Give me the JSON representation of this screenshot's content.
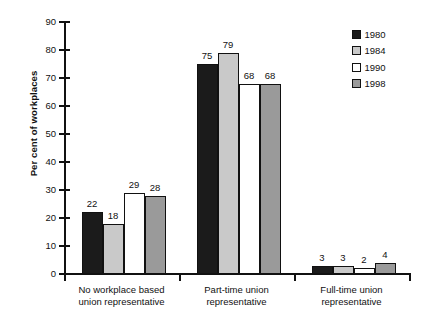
{
  "chart_data": {
    "type": "bar",
    "title": "",
    "subtitle": "",
    "xlabel": "",
    "ylabel": "Per cent of workplaces",
    "ylim": [
      0,
      90
    ],
    "ytick_labels": [
      "0",
      "10",
      "20",
      "30",
      "40",
      "50",
      "60",
      "70",
      "80",
      "90"
    ],
    "ytick_values": [
      0,
      10,
      20,
      30,
      40,
      50,
      60,
      70,
      80,
      90
    ],
    "grid": false,
    "legend_position": "top-right",
    "categories": [
      "No workplace based union representative",
      "Part-time union representative",
      "Full-time union representative"
    ],
    "category_lines": [
      [
        "No workplace based",
        "union representative"
      ],
      [
        "Part-time union",
        "representative"
      ],
      [
        "Full-time union",
        "representative"
      ]
    ],
    "series": [
      {
        "name": "1980",
        "color": "#1b1b1b",
        "values": [
          22,
          75,
          3
        ]
      },
      {
        "name": "1984",
        "color": "#c9c9c9",
        "values": [
          18,
          79,
          3
        ]
      },
      {
        "name": "1990",
        "color": "#ffffff",
        "values": [
          29,
          68,
          2
        ]
      },
      {
        "name": "1998",
        "color": "#9a9a9a",
        "values": [
          28,
          68,
          4
        ]
      }
    ],
    "data_labels": [
      [
        "22",
        "18",
        "29",
        "28"
      ],
      [
        "75",
        "79",
        "68",
        "68"
      ],
      [
        "3",
        "3",
        "2",
        "4"
      ]
    ]
  },
  "legend": {
    "items": [
      {
        "label": "1980",
        "color": "#1b1b1b"
      },
      {
        "label": "1984",
        "color": "#c9c9c9"
      },
      {
        "label": "1990",
        "color": "#ffffff"
      },
      {
        "label": "1998",
        "color": "#9a9a9a"
      }
    ]
  },
  "colors": {
    "axis": "#111111",
    "text": "#111111",
    "background": "#ffffff"
  }
}
